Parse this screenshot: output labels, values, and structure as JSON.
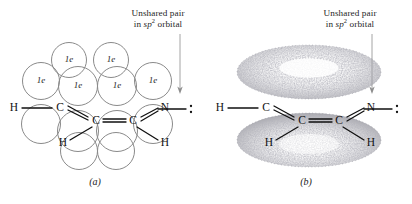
{
  "figure": {
    "background_color": "#ffffff",
    "line_color": "#8a8a8a",
    "bond_color": "#111111",
    "stipple_color": "#7d7d86"
  },
  "panels": [
    {
      "id": "a",
      "caption": "(a)",
      "type": "orbital-overlap-circles",
      "callout": {
        "line1": "Unshared pair",
        "line2_prefix": "in ",
        "line2_orbital": "sp",
        "line2_sup": "2",
        "line2_suffix": " orbital"
      },
      "orbital_label": "1e",
      "labeled_orbital_count": 6,
      "unlabeled_orbital_count": 6,
      "total_orbital_count": 12
    },
    {
      "id": "b",
      "caption": "(b)",
      "type": "pi-electron-cloud-torus",
      "callout": {
        "line1": "Unshared pair",
        "line2_prefix": "in ",
        "line2_orbital": "sp",
        "line2_sup": "2",
        "line2_suffix": " orbital"
      },
      "lobe_count": 2
    }
  ],
  "molecule": {
    "atoms": {
      "h_left": "H",
      "c_upper_left": "C",
      "c_center_left": "C",
      "c_center_right": "C",
      "n_right": "N",
      "h_lower_left": "H",
      "h_lower_right": "H"
    },
    "lone_pair_dots": 2
  }
}
